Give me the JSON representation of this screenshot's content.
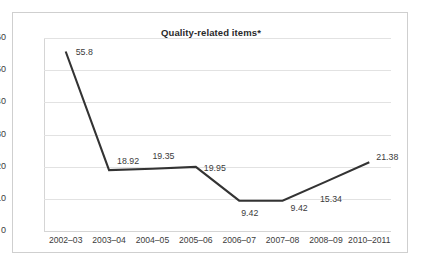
{
  "chart_data": {
    "type": "line",
    "title": "Quality-related items*",
    "xlabel": "",
    "ylabel": "",
    "categories": [
      "2002–03",
      "2003–04",
      "2004–05",
      "2005–06",
      "2006–07",
      "2007–08",
      "2008–09",
      "2010–2011"
    ],
    "values": [
      55.8,
      18.92,
      19.35,
      19.95,
      9.42,
      9.42,
      15.34,
      21.38
    ],
    "value_labels": [
      "55.8",
      "18.92",
      "19.35",
      "19.95",
      "9.42",
      "9.42",
      "15.34",
      "21.38"
    ],
    "ylim": [
      0,
      60
    ],
    "yticks": [
      0,
      10,
      20,
      30,
      40,
      50,
      60
    ],
    "ytick_labels": [
      "0",
      "10",
      "20",
      "30",
      "40",
      "50",
      "60"
    ],
    "grid": "horizontal",
    "legend": "none",
    "series": [
      {
        "name": "Quality-related items",
        "values": [
          55.8,
          18.92,
          19.35,
          19.95,
          9.42,
          9.42,
          15.34,
          21.38
        ]
      }
    ],
    "colors": {
      "line": "#333333",
      "grid": "#e2e2e2",
      "axis": "#d5d5d5",
      "text": "#3b3b3b",
      "frame": "#cfcfcf",
      "background": "#ffffff"
    },
    "label_offsets": [
      {
        "dx": 10,
        "dy": -4
      },
      {
        "dx": 8,
        "dy": -13
      },
      {
        "dx": 0,
        "dy": -17
      },
      {
        "dx": 8,
        "dy": -3
      },
      {
        "dx": 2,
        "dy": 8
      },
      {
        "dx": 8,
        "dy": 3
      },
      {
        "dx": -6,
        "dy": 13
      },
      {
        "dx": 7,
        "dy": -9
      }
    ]
  }
}
